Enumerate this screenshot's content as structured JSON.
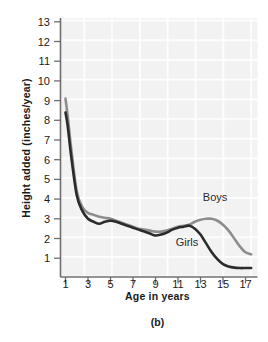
{
  "figure": {
    "caption": "(b)",
    "xlabel": "Age in years",
    "ylabel": "Height added (inches/year)"
  },
  "annotations": {
    "boys_label": "Boys",
    "girls_label": "Girls"
  },
  "colors": {
    "boys_line": "#8d8d8d",
    "girls_line": "#2b2b2b",
    "axis": "#6f6f6f",
    "grid": "#ededed",
    "plot_bg": "#f6f6f6",
    "text": "#1a1a1a"
  },
  "chart_data": {
    "type": "line",
    "title": "",
    "xlabel": "Age in years",
    "ylabel": "Height added (inches/year)",
    "xlim": [
      1,
      17.8
    ],
    "ylim": [
      0,
      13.6
    ],
    "grid": true,
    "legend": "inline-labels",
    "xticks": [
      1,
      3,
      5,
      7,
      9,
      11,
      13,
      15,
      17
    ],
    "xticklabels": [
      "1",
      "3",
      "5",
      "7",
      "9",
      "11",
      "13",
      "15",
      "17"
    ],
    "yticks": [
      1,
      2,
      3,
      4,
      5,
      6,
      7,
      8,
      9,
      10,
      11,
      12,
      13
    ],
    "yticklabels": [
      "1",
      "2",
      "3",
      "4",
      "5",
      "6",
      "7",
      "8",
      "9",
      "10",
      "11",
      "12",
      "13"
    ],
    "x": [
      1,
      1.2,
      1.5,
      2,
      2.5,
      3,
      3.5,
      4,
      4.5,
      5,
      5.5,
      6,
      6.5,
      7,
      7.5,
      8,
      8.5,
      9,
      9.5,
      10,
      10.5,
      11,
      11.5,
      12,
      12.5,
      13,
      13.5,
      14,
      14.5,
      15,
      15.5,
      16,
      16.5,
      17,
      17.5
    ],
    "series": [
      {
        "name": "Boys",
        "color": "#8d8d8d",
        "values": [
          9.1,
          8.2,
          6.6,
          4.4,
          3.6,
          3.3,
          3.2,
          3.1,
          3.05,
          3.0,
          2.9,
          2.8,
          2.7,
          2.6,
          2.5,
          2.45,
          2.4,
          2.35,
          2.35,
          2.4,
          2.5,
          2.6,
          2.65,
          2.7,
          2.85,
          2.95,
          3.0,
          3.0,
          2.9,
          2.7,
          2.4,
          2.0,
          1.6,
          1.3,
          1.2
        ]
      },
      {
        "name": "Girls",
        "color": "#2b2b2b",
        "values": [
          8.4,
          7.7,
          6.2,
          4.2,
          3.4,
          3.0,
          2.85,
          2.75,
          2.85,
          2.9,
          2.85,
          2.75,
          2.65,
          2.55,
          2.45,
          2.35,
          2.25,
          2.15,
          2.2,
          2.3,
          2.45,
          2.55,
          2.6,
          2.65,
          2.5,
          2.2,
          1.75,
          1.3,
          0.95,
          0.7,
          0.58,
          0.52,
          0.5,
          0.5,
          0.5
        ]
      }
    ],
    "annotations": [
      {
        "text": "Boys",
        "x": 14.3,
        "y": 3.9
      },
      {
        "text": "Girls",
        "x": 11.8,
        "y": 1.6
      }
    ]
  }
}
